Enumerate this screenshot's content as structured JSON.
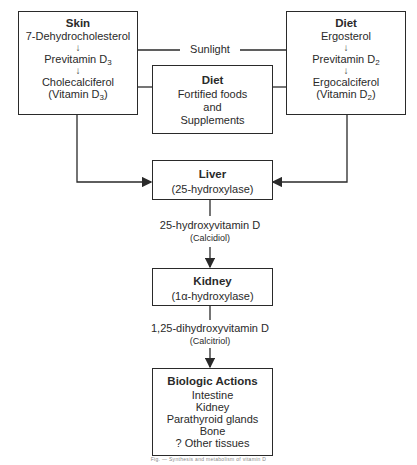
{
  "diagram": {
    "skin_box": {
      "title": "Skin",
      "steps": [
        "7-Dehydrocholesterol",
        "Previtamin D",
        "Cholecalciferol",
        "(Vitamin D"
      ],
      "subscripts": [
        "3",
        "3"
      ],
      "arrow_glyph": "↓"
    },
    "diet_right_box": {
      "title": "Diet",
      "steps": [
        "Ergosterol",
        "Previtamin D",
        "Ergocalciferol",
        "(Vitamin D"
      ],
      "subscripts": [
        "2",
        "2"
      ],
      "arrow_glyph": "↓"
    },
    "diet_middle_box": {
      "title": "Diet",
      "lines": [
        "Fortified foods",
        "and",
        "Supplements"
      ]
    },
    "sunlight_label": "Sunlight",
    "liver_box": {
      "title": "Liver",
      "subtitle": "(25-hydroxylase)"
    },
    "liver_product": {
      "name": "25-hydroxyvitamin D",
      "alias": "(Calcidiol)"
    },
    "kidney_box": {
      "title": "Kidney",
      "subtitle": "(1α-hydroxylase)"
    },
    "kidney_product": {
      "name": "1,25-dihydroxyvitamin D",
      "alias": "(Calcitriol)"
    },
    "actions_box": {
      "title": "Biologic Actions",
      "items": [
        "Intestine",
        "Kidney",
        "Parathyroid glands",
        "Bone",
        "? Other tissues"
      ]
    },
    "caption": "Fig. — Synthesis and metabolism of vitamin D",
    "colors": {
      "line": "#2a2a2a",
      "text": "#2a2a2a",
      "background": "#ffffff"
    }
  }
}
